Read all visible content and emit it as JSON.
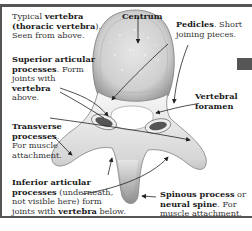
{
  "diagram": {
    "title": "Typical vertebra (thoracic vertebra). Seen from above.",
    "labels": {
      "typical": {
        "pre": "Typical ",
        "bold1": "vertebra",
        "mid": " (",
        "bold2": "thoracic vertebra",
        "post": ").",
        "line2": "Seen from above."
      },
      "centrum": {
        "bold": "Centrum"
      },
      "pedicles": {
        "bold": "Pedicles",
        "rest": ". Short",
        "line2": "joining pieces."
      },
      "superior": {
        "bold1": "Superior articular",
        "bold2": "processes",
        "rest": ". Form",
        "line3": "joints with",
        "bold3": "vertebra",
        "line5": "above."
      },
      "foramen": {
        "bold1": "Vertebral",
        "bold2": "foramen"
      },
      "transverse": {
        "bold1": "Transverse",
        "bold2": "processes",
        "rest": ".",
        "line3": "For muscle",
        "line4": "attachment."
      },
      "inferior": {
        "bold1": "Inferior articular",
        "bold2": "processes",
        "rest": " (underneath,",
        "line3": "not visible here) form",
        "line4pre": "joints with ",
        "bold3": "vertebra",
        "line4post": " below."
      },
      "spinous": {
        "bold1": "Spinous process",
        "rest1": " or",
        "bold2": "neural spine",
        "rest2": ". For",
        "line3": "muscle attachment."
      }
    },
    "colors": {
      "bone_light": "#f2f2f2",
      "bone_mid": "#c8c8c8",
      "bone_dark": "#8a8a8a",
      "frame": "#555555",
      "text": "#333333"
    }
  }
}
